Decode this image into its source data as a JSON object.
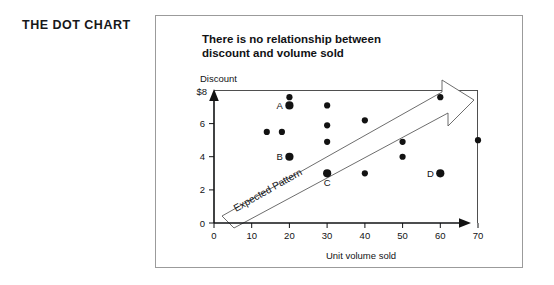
{
  "section": {
    "title": "THE DOT CHART"
  },
  "chart_data": {
    "type": "scatter",
    "title": "There is no relationship between discount and volume sold",
    "title_line1": "There is no relationship between",
    "title_line2": "discount and volume sold",
    "xlabel": "Unit volume sold",
    "ylabel": "Discount",
    "ylabel_top_tick": "$8",
    "xlim": [
      0,
      70
    ],
    "ylim": [
      0,
      8
    ],
    "grid": false,
    "legend": "none",
    "xticks": [
      "0",
      "10",
      "20",
      "30",
      "40",
      "50",
      "60",
      "70"
    ],
    "xtick_values": [
      0,
      10,
      20,
      30,
      40,
      50,
      60,
      70
    ],
    "yticks": [
      "0",
      "2",
      "4",
      "6",
      "$8"
    ],
    "ytick_values": [
      0,
      2,
      4,
      6,
      8
    ],
    "points": [
      {
        "x": 20,
        "y": 7.6,
        "label": ""
      },
      {
        "x": 20,
        "y": 7.1,
        "label": "A"
      },
      {
        "x": 14,
        "y": 5.5,
        "label": ""
      },
      {
        "x": 18,
        "y": 5.5,
        "label": ""
      },
      {
        "x": 20,
        "y": 4.0,
        "label": "B"
      },
      {
        "x": 30,
        "y": 7.1,
        "label": ""
      },
      {
        "x": 30,
        "y": 5.9,
        "label": ""
      },
      {
        "x": 30,
        "y": 4.9,
        "label": ""
      },
      {
        "x": 30,
        "y": 3.0,
        "label": "C"
      },
      {
        "x": 40,
        "y": 6.2,
        "label": ""
      },
      {
        "x": 40,
        "y": 3.0,
        "label": ""
      },
      {
        "x": 50,
        "y": 4.9,
        "label": ""
      },
      {
        "x": 50,
        "y": 4.0,
        "label": ""
      },
      {
        "x": 60,
        "y": 7.6,
        "label": ""
      },
      {
        "x": 60,
        "y": 3.0,
        "label": "D"
      },
      {
        "x": 70,
        "y": 5.0,
        "label": ""
      }
    ],
    "annotations": [
      {
        "text": "Expected Pattern",
        "type": "arrow-band",
        "from": {
          "x": 2,
          "y": 1.0
        },
        "to": {
          "x": 64,
          "y": 7.6
        },
        "rotation_deg": -26
      }
    ],
    "colors": {
      "dot": "#121212",
      "axis": "#111214",
      "frame": "#3b3b3b",
      "arrow_stroke": "#5c5c5c",
      "panel_border": "#9b9b9b",
      "background": "#ffffff",
      "text": "#121315"
    }
  }
}
